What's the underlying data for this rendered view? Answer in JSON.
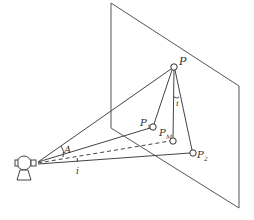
{
  "diagram": {
    "title": "",
    "colors": {
      "line": "#444444",
      "plane": "#555555",
      "background": "#ffffff"
    },
    "plane": {
      "corners": [
        [
          111,
          3
        ],
        [
          239,
          86
        ],
        [
          239,
          208
        ],
        [
          111,
          128
        ]
      ]
    },
    "observer": {
      "position": [
        37,
        163
      ]
    },
    "points": [
      {
        "id": "P",
        "label": "P",
        "subscript": "",
        "x": 174,
        "y": 67
      },
      {
        "id": "P1",
        "label": "P",
        "subscript": "1",
        "x": 153,
        "y": 127
      },
      {
        "id": "PM",
        "label": "P",
        "subscript": "M",
        "x": 173,
        "y": 141
      },
      {
        "id": "P2",
        "label": "P",
        "subscript": "2",
        "x": 193,
        "y": 153
      }
    ],
    "angles": [
      {
        "label": "A",
        "x": 64,
        "y": 152
      },
      {
        "label": "i",
        "x": 77,
        "y": 172
      },
      {
        "label": "i",
        "x": 178,
        "y": 104
      }
    ]
  }
}
